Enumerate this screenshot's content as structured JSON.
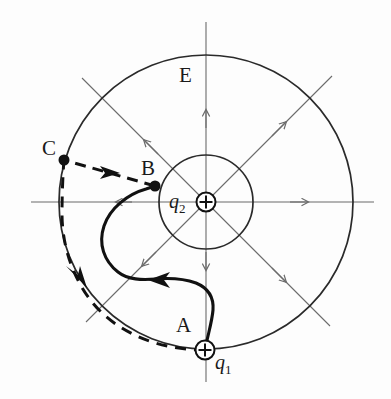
{
  "figure": {
    "background_color": "#fdfdfd",
    "ink_color": "#1a1a1a",
    "field_line_color": "#6b6b6b"
  },
  "labels": {
    "field": "E",
    "point_a": "A",
    "point_b": "B",
    "point_c": "C",
    "charge_1_symbol": "q",
    "charge_1_sub": "1",
    "charge_2_symbol": "q",
    "charge_2_sub": "2"
  },
  "geometry": {
    "center_x": 206,
    "center_y": 202,
    "inner_circle_radius": 47,
    "outer_circle_radius": 147,
    "point_a": {
      "x": 205,
      "y": 350
    },
    "point_b": {
      "x": 155,
      "y": 186
    },
    "point_c": {
      "x": 64,
      "y": 160
    },
    "charge_2": {
      "x": 206,
      "y": 202
    }
  },
  "elements": {
    "outer_equipotential": "outer-circle",
    "inner_equipotential": "inner-circle",
    "field_lines": [
      "horizontal-axis",
      "vertical-axis",
      "diagonal-nesw",
      "diagonal-nwse"
    ],
    "solid_path_label": "solid-path-a-to-b",
    "dashed_path_bc_label": "dashed-path-b-to-c",
    "dashed_path_ca_label": "dashed-arc-c-to-a"
  }
}
